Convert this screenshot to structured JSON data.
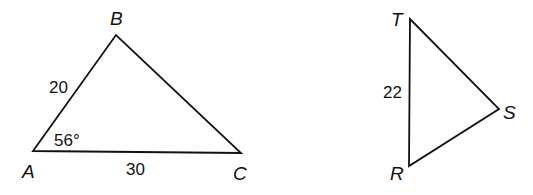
{
  "diagram": {
    "triangles": [
      {
        "id": "ABC",
        "vertices": {
          "A": {
            "label": "A",
            "x": 33,
            "y": 151
          },
          "B": {
            "label": "B",
            "x": 116,
            "y": 35
          },
          "C": {
            "label": "C",
            "x": 241,
            "y": 153
          }
        },
        "side_AB": "20",
        "side_AC": "30",
        "angle_A": "56°"
      },
      {
        "id": "TRS",
        "vertices": {
          "T": {
            "label": "T",
            "x": 410,
            "y": 19
          },
          "R": {
            "label": "R",
            "x": 409,
            "y": 166
          },
          "S": {
            "label": "S",
            "x": 499,
            "y": 109
          }
        },
        "side_TR": "22"
      }
    ],
    "colors": {
      "stroke": "#111111",
      "background": "#ffffff"
    }
  }
}
